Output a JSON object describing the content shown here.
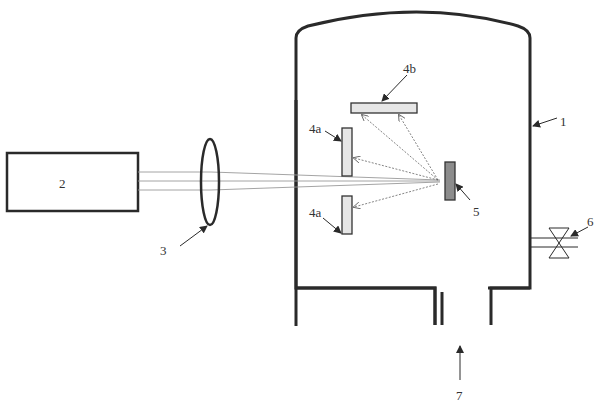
{
  "diagram": {
    "type": "schematic",
    "components": {
      "chamber": {
        "label": "1"
      },
      "laser": {
        "label": "2"
      },
      "lens": {
        "label": "3"
      },
      "substrate_side_top": {
        "label": "4a"
      },
      "substrate_side_bottom": {
        "label": "4a"
      },
      "substrate_top": {
        "label": "4b"
      },
      "target": {
        "label": "5"
      },
      "valve": {
        "label": "6"
      },
      "gas_inlet": {
        "label": "7"
      }
    },
    "colors": {
      "line": "#2a2a2a",
      "beam": "#999999",
      "substrate_fill": "#e6e6e6",
      "target_fill": "#8c8c8c"
    }
  }
}
